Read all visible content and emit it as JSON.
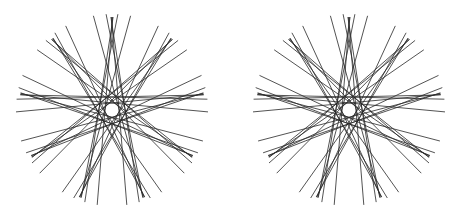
{
  "figure": {
    "stroke_color": "#2a2a2a",
    "background": "#ffffff",
    "panels": [
      {
        "name": "left-pattern",
        "cx": 112,
        "cy": 110
      },
      {
        "name": "right-pattern",
        "cx": 349,
        "cy": 110
      }
    ],
    "pattern": {
      "symmetry": 9,
      "fan_radius": 86,
      "outer_radius": 96,
      "tangent_radii": [
        7,
        13
      ],
      "fan_overshoot": 7
    }
  }
}
